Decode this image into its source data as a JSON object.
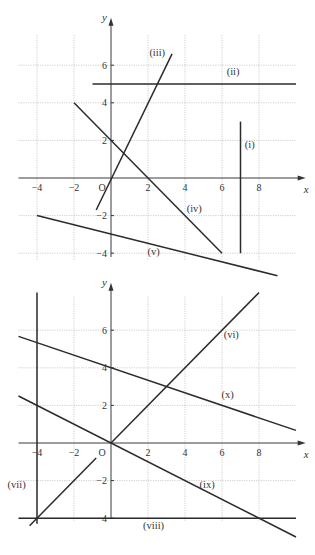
{
  "chart_data": [
    {
      "type": "line",
      "title": "",
      "xlabel": "x",
      "ylabel": "y",
      "xlim": [
        -5,
        10
      ],
      "ylim": [
        -5.5,
        7.5
      ],
      "x_ticks": [
        -4,
        -2,
        2,
        4,
        6,
        8
      ],
      "y_ticks": [
        -4,
        -2,
        2,
        4,
        6
      ],
      "origin_label": "O",
      "grid": true,
      "series": [
        {
          "name": "(i)",
          "equation": "x = 7",
          "points": [
            [
              7,
              3
            ],
            [
              7,
              -4
            ]
          ],
          "label_pos": [
            7.5,
            1.6
          ]
        },
        {
          "name": "(ii)",
          "equation": "y = 5",
          "points": [
            [
              -1,
              5
            ],
            [
              10,
              5
            ]
          ],
          "label_pos": [
            6.6,
            5.5
          ]
        },
        {
          "name": "(iii)",
          "equation": "y = 2x",
          "points": [
            [
              -0.8,
              -1.7
            ],
            [
              3.3,
              6.6
            ]
          ],
          "label_pos": [
            2.5,
            6.5
          ]
        },
        {
          "name": "(iv)",
          "equation": "y = 2 - x",
          "points": [
            [
              -2,
              4
            ],
            [
              6,
              -4
            ]
          ],
          "label_pos": [
            4.5,
            -1.8
          ]
        },
        {
          "name": "(v)",
          "equation": "y = -3 - x/4",
          "points": [
            [
              -4,
              -2
            ],
            [
              9,
              -5.2
            ]
          ],
          "label_pos": [
            2.3,
            -4.1
          ]
        }
      ]
    },
    {
      "type": "line",
      "title": "",
      "xlabel": "x",
      "ylabel": "y",
      "xlim": [
        -5,
        10
      ],
      "ylim": [
        -5,
        8
      ],
      "x_ticks": [
        -4,
        -2,
        2,
        4,
        6,
        8
      ],
      "y_ticks": [
        -4,
        -2,
        2,
        4,
        6
      ],
      "origin_label": "O",
      "grid": true,
      "series": [
        {
          "name": "(vi)",
          "equation": "y = x",
          "points": [
            [
              0,
              0
            ],
            [
              8,
              8
            ]
          ],
          "label_pos": [
            6.5,
            5.6
          ]
        },
        {
          "name": "(vii)",
          "equation": "x = -4",
          "points": [
            [
              -4,
              8
            ],
            [
              -4,
              -4.3
            ]
          ],
          "label_pos": [
            -5.1,
            -2.4
          ]
        },
        {
          "name": "(viii)",
          "equation": "y = -4",
          "points": [
            [
              -5,
              -4
            ],
            [
              10,
              -4
            ]
          ],
          "label_pos": [
            2.3,
            -4.6
          ]
        },
        {
          "name": "(ix)",
          "equation": "y = -x/2",
          "points": [
            [
              -5,
              2.5
            ],
            [
              10,
              -5
            ]
          ],
          "label_pos": [
            5.2,
            -2.4
          ]
        },
        {
          "name": "(x)",
          "equation": "y = 4 - x/3",
          "points": [
            [
              -5,
              5.67
            ],
            [
              10,
              0.67
            ]
          ],
          "label_pos": [
            6.3,
            2.4
          ]
        },
        {
          "name": "(vii-diag)",
          "equation": "y = x (segment)",
          "points": [
            [
              -4.4,
              -4.4
            ],
            [
              -0.8,
              -0.8
            ]
          ]
        }
      ]
    }
  ]
}
